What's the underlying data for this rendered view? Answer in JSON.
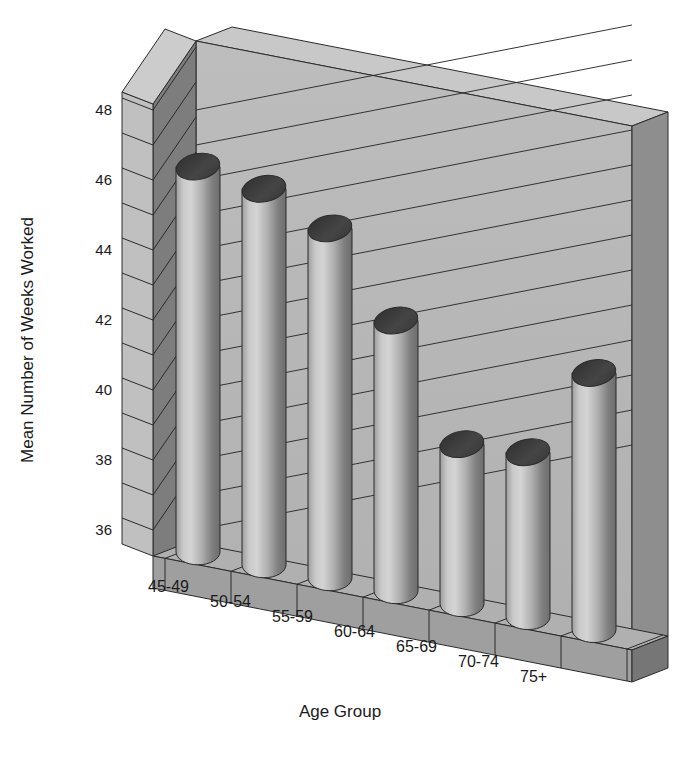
{
  "chart_data": {
    "type": "bar",
    "title": "",
    "subtitle": "",
    "xlabel": "Age Group",
    "ylabel": "Mean Number of Weeks Worked",
    "categories": [
      "45-49",
      "50-54",
      "55-59",
      "60-64",
      "65-69",
      "70-74",
      "75+"
    ],
    "values": [
      47.0,
      46.0,
      44.5,
      41.5,
      37.6,
      37.0,
      38.9
    ],
    "ylim": [
      35,
      48
    ],
    "yticks": [
      36,
      38,
      40,
      42,
      44,
      46,
      48
    ],
    "ytick_labels": [
      "36",
      "38",
      "40",
      "42",
      "44",
      "46",
      "48"
    ],
    "gridlines": [
      36,
      37,
      38,
      39,
      40,
      41,
      42,
      43,
      44,
      45,
      46,
      47,
      48
    ],
    "grid": true,
    "legend": null,
    "legend_position": "none",
    "style": "3d-cylinder",
    "annotations": []
  },
  "colors": {
    "background": "#ffffff",
    "wall_face": "#b4b4b4",
    "wall_top": "#c8c8c8",
    "wall_side_dark": "#8e8e8e",
    "wall_side_left": "#7d7d7d",
    "floor_top": "#b0b0b0",
    "floor_front": "#9a9a9a",
    "floor_right": "#767676",
    "bar_light": "#cfcfcf",
    "bar_mid": "#a8a8a8",
    "bar_dark": "#6e6e6e",
    "bar_top_ellipse": "#3c3c3c",
    "outline": "#2b2b2b",
    "text": "#1a1a1a"
  },
  "axes": {
    "y_title": "Mean Number of Weeks Worked",
    "x_title": "Age Group"
  }
}
